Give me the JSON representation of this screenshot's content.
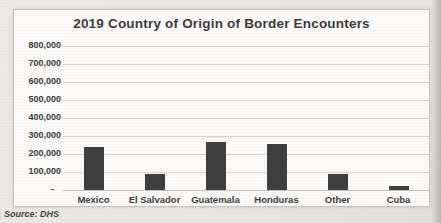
{
  "chart_data": {
    "type": "bar",
    "title": "2019 Country of Origin of Border Encounters",
    "categories": [
      "Mexico",
      "El Salvador",
      "Guatemala",
      "Honduras",
      "Other",
      "Cuba"
    ],
    "values": [
      237000,
      90000,
      265000,
      255000,
      90000,
      20000
    ],
    "xlabel": "",
    "ylabel": "",
    "ylim": [
      0,
      800000
    ],
    "ytick_interval": 100000,
    "ytick_labels_top_down": [
      "800,000",
      "700,000",
      "600,000",
      "500,000",
      "400,000",
      "300,000",
      "200,000",
      "100,000"
    ],
    "zero_tick_label": "-",
    "grid": "horizontal",
    "legend": "none",
    "source_note": "Source: DHS"
  },
  "colors": {
    "bar": "#3f3f3f",
    "gridline": "#d4d2ce",
    "gridline_baseline": "#c2c0bc",
    "frame_border": "#c6c4c0",
    "text": "#3b3b3b"
  }
}
